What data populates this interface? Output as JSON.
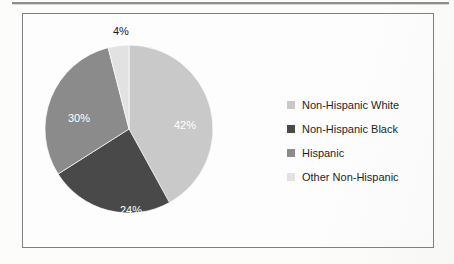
{
  "figure": {
    "frame_border_color": "#808080",
    "background_color": "#fdfdfd"
  },
  "chart_data": {
    "type": "pie",
    "title": "",
    "subtitle": "",
    "xlabel": "",
    "ylabel": "",
    "legend_position": "right",
    "start_angle_deg": 0,
    "direction": "clockwise",
    "categories": [
      "Non-Hispanic White",
      "Non-Hispanic Black",
      "Hispanic",
      "Other Non-Hispanic"
    ],
    "values": [
      42,
      24,
      30,
      4
    ],
    "value_unit": "%",
    "data_labels": [
      "42%",
      "24%",
      "30%",
      "4%"
    ],
    "data_label_placement": [
      "inside",
      "inside",
      "inside",
      "outside"
    ],
    "colors": [
      "#c9c9c9",
      "#494949",
      "#8b8b8b",
      "#e2e2e2"
    ],
    "slices": [
      {
        "label": "Non-Hispanic White",
        "value": 42,
        "data_label": "42%",
        "color": "#c9c9c9",
        "label_color": "#ffffff"
      },
      {
        "label": "Non-Hispanic Black",
        "value": 24,
        "data_label": "24%",
        "color": "#494949",
        "label_color": "#ffffff"
      },
      {
        "label": "Hispanic",
        "value": 30,
        "data_label": "30%",
        "color": "#8b8b8b",
        "label_color": "#ffffff"
      },
      {
        "label": "Other Non-Hispanic",
        "value": 4,
        "data_label": "4%",
        "color": "#e2e2e2",
        "label_color": "#1c1c1c"
      }
    ]
  },
  "legend": {
    "items": [
      {
        "label": "Non-Hispanic White",
        "swatch_color": "#c9c9c9"
      },
      {
        "label": "Non-Hispanic Black",
        "swatch_color": "#494949"
      },
      {
        "label": "Hispanic",
        "swatch_color": "#8b8b8b"
      },
      {
        "label": "Other Non-Hispanic",
        "swatch_color": "#e2e2e2"
      }
    ]
  }
}
